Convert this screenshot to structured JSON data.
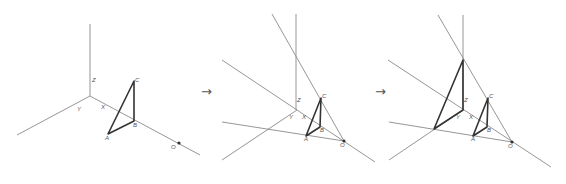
{
  "diagram": {
    "arrows": [
      "→",
      "→"
    ],
    "panels": [
      {
        "id": "step-1",
        "labels": {
          "z": "Z",
          "y": "Y",
          "x": "X",
          "a": "A",
          "b": "B",
          "c": "C",
          "o": "O"
        }
      },
      {
        "id": "step-2",
        "labels": {
          "z": "Z",
          "y": "Y",
          "x": "X",
          "a": "A",
          "b": "B",
          "c": "C",
          "o": "O"
        }
      },
      {
        "id": "step-3",
        "labels": {
          "z": "Z",
          "y": "Y",
          "x": "X",
          "a": "A",
          "b": "B",
          "c": "C",
          "o": "O"
        }
      }
    ]
  }
}
